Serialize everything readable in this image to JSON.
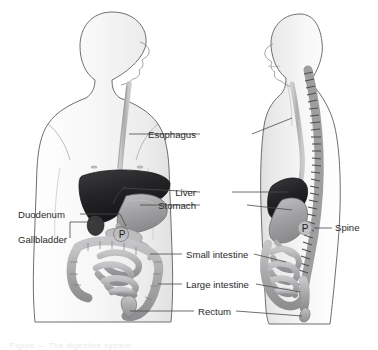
{
  "figure": {
    "views": [
      "anterior",
      "lateral"
    ],
    "background_color": "#ffffff",
    "body_fill": "#f4f4f4",
    "outline_color": "#6e6e6e",
    "leader_color": "#4a4a4a",
    "label_color": "#2b2b2b"
  },
  "labels": [
    {
      "id": "esophagus",
      "text": "Esophagus",
      "align": "end",
      "x": 196,
      "y": 138
    },
    {
      "id": "liver",
      "text": "Liver",
      "align": "end",
      "x": 196,
      "y": 196
    },
    {
      "id": "stomach",
      "text": "Stomach",
      "align": "end",
      "x": 196,
      "y": 209
    },
    {
      "id": "duodenum",
      "text": "Duodenum",
      "align": "start",
      "x": 18,
      "y": 218
    },
    {
      "id": "gallbladder",
      "text": "Gallbladder",
      "align": "start",
      "x": 18,
      "y": 243
    },
    {
      "id": "small-intestine",
      "text": "Small intestine",
      "align": "start",
      "x": 186,
      "y": 258
    },
    {
      "id": "large-intestine",
      "text": "Large intestine",
      "align": "start",
      "x": 186,
      "y": 288
    },
    {
      "id": "rectum",
      "text": "Rectum",
      "align": "start",
      "x": 198,
      "y": 315
    },
    {
      "id": "spine",
      "text": "Spine",
      "align": "start",
      "x": 335,
      "y": 231
    }
  ],
  "organ_marks": [
    {
      "id": "pancreas-anterior",
      "text": "P",
      "x": 122,
      "y": 238
    },
    {
      "id": "pancreas-lateral",
      "text": "P",
      "x": 305,
      "y": 231
    }
  ],
  "organ_colors": {
    "liver": "#2a2a2c",
    "stomach": "#9d9d9f",
    "esophagus": "#b4b4b6",
    "intestine": "#a9a9ab",
    "gallbladder": "#3a3a3c",
    "spine": "#8e8e90",
    "pancreas": "#b9b9bb"
  },
  "caption": {
    "text": "Figure  —  The digestive system"
  }
}
